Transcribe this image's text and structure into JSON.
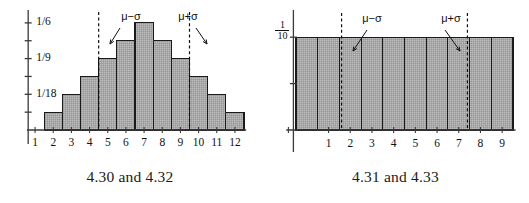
{
  "figures": [
    {
      "id": "left",
      "caption": "4.30 and 4.32",
      "y_axis_labels": [
        {
          "text": "1/6",
          "value": 0.16667
        },
        {
          "text": "1/9",
          "value": 0.11111
        },
        {
          "text": "1/18",
          "value": 0.05556
        }
      ],
      "annotations": [
        {
          "name": "mu-minus-sigma",
          "text": "μ−σ",
          "x": 4.5
        },
        {
          "name": "mu-plus-sigma",
          "text": "μ+σ",
          "x": 9.5
        }
      ],
      "chart_data": {
        "type": "bar",
        "title": "",
        "xlabel": "",
        "ylabel": "",
        "categories": [
          "1",
          "2",
          "3",
          "4",
          "5",
          "6",
          "7",
          "8",
          "9",
          "10",
          "11",
          "12"
        ],
        "values": [
          0,
          0.027778,
          0.055556,
          0.083333,
          0.111111,
          0.138889,
          0.166667,
          0.138889,
          0.111111,
          0.083333,
          0.055556,
          0.027778
        ],
        "value_fractions": [
          "0",
          "1/36",
          "2/36",
          "3/36",
          "4/36",
          "5/36",
          "6/36",
          "5/36",
          "4/36",
          "3/36",
          "2/36",
          "1/36"
        ],
        "xlim": [
          0.5,
          12.5
        ],
        "ylim": [
          0,
          0.1805
        ],
        "y_ticks": [
          0.027778,
          0.055556,
          0.083333,
          0.111111,
          0.138889,
          0.166667
        ],
        "y_tick_labels": [
          "",
          "1/18",
          "",
          "1/9",
          "",
          "1/6"
        ],
        "x_ticks": [
          1,
          2,
          3,
          4,
          5,
          6,
          7,
          8,
          9,
          10,
          11,
          12
        ],
        "x_tick_labels": [
          "1",
          "2",
          "3",
          "4",
          "5",
          "6",
          "7",
          "8",
          "9",
          "10",
          "11",
          "12"
        ],
        "grid": false,
        "legend": null,
        "bar_fill": "#a9a9a9",
        "bar_edge": "#1a1a1a",
        "annotation_lines": [
          4.5,
          9.5
        ],
        "annotation_line_style": "dashed"
      }
    },
    {
      "id": "right",
      "caption": "4.31 and 4.33",
      "y_axis_labels": [
        {
          "text": "1/10",
          "numerator": "1",
          "denominator": "10",
          "value": 0.1
        }
      ],
      "annotations": [
        {
          "name": "mu-minus-sigma",
          "text": "μ−σ",
          "x": 1.6
        },
        {
          "name": "mu-plus-sigma",
          "text": "μ+σ",
          "x": 7.4
        }
      ],
      "chart_data": {
        "type": "bar",
        "title": "",
        "xlabel": "",
        "ylabel": "",
        "categories": [
          "0",
          "1",
          "2",
          "3",
          "4",
          "5",
          "6",
          "7",
          "8",
          "9"
        ],
        "values": [
          0.1,
          0.1,
          0.1,
          0.1,
          0.1,
          0.1,
          0.1,
          0.1,
          0.1,
          0.1
        ],
        "value_fractions": [
          "1/10",
          "1/10",
          "1/10",
          "1/10",
          "1/10",
          "1/10",
          "1/10",
          "1/10",
          "1/10",
          "1/10"
        ],
        "xlim": [
          -0.5,
          9.5
        ],
        "ylim": [
          0,
          0.125
        ],
        "y_ticks": [
          0.05,
          0.1
        ],
        "y_tick_labels": [
          "",
          "1/10"
        ],
        "x_ticks": [
          1,
          2,
          3,
          4,
          5,
          6,
          7,
          8,
          9
        ],
        "x_tick_labels": [
          "1",
          "2",
          "3",
          "4",
          "5",
          "6",
          "7",
          "8",
          "9"
        ],
        "grid": false,
        "legend": null,
        "bar_fill": "#a9a9a9",
        "bar_edge": "#1a1a1a",
        "annotation_lines": [
          1.6,
          7.4
        ],
        "annotation_line_style": "dashed"
      }
    }
  ],
  "colors": {
    "bar_fill": "#a9a9a9",
    "bar_edge": "#1a1a1a",
    "axis": "#3a3a3a",
    "text": "#111111",
    "background": "#ffffff"
  }
}
